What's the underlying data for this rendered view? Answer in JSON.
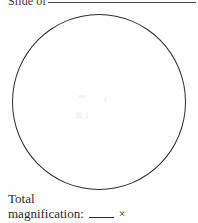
{
  "page": {
    "background_color": "#fefefe",
    "ink_color": "#2b2b2b"
  },
  "heading": {
    "slide_label": "Slide of",
    "slide_blank_value": "",
    "rule_color": "#4a4a4a"
  },
  "drawing_area": {
    "shape": "circle",
    "label": "field-of-view circle",
    "outline_color": "#2e2e2e",
    "fill_color": "transparent",
    "contents": ""
  },
  "caption": {
    "line1": "Total",
    "line2_label": "magnification:",
    "magnification_value": "",
    "times_symbol": "×"
  }
}
